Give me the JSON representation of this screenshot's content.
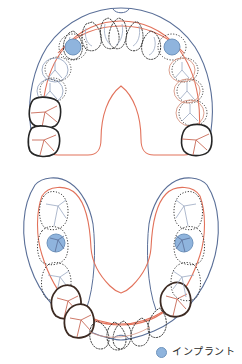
{
  "figure": {
    "title": "",
    "type": "dental-arch-diagram",
    "width": 242,
    "height": 364,
    "background_color": "#ffffff"
  },
  "legend": {
    "items": [
      {
        "marker": "implant-marker",
        "marker_shape": "circle",
        "marker_color": "#8fb4dd",
        "marker_stroke": "#6f94bd",
        "label": "インプラント"
      }
    ]
  },
  "colors": {
    "gingiva_outline": "#5a6f98",
    "denture_base": "#e2725b",
    "tooth_dotted": "#3a3a3a",
    "tooth_solid": "#262626",
    "tooth_light": "#9aa8c2",
    "implant_fill": "#8fb4dd",
    "implant_stroke": "#6f94bd",
    "text": "#2b2b2b"
  },
  "arches": [
    {
      "name": "upper-arch",
      "position": "top",
      "label": "",
      "teeth": [
        {
          "id": "UL8",
          "style": "absent",
          "x": 0,
          "y": 0
        },
        {
          "id": "UL7",
          "style": "solid",
          "x": 44,
          "y": 131,
          "note": "existing-tooth"
        },
        {
          "id": "UL6",
          "style": "solid",
          "x": 45,
          "y": 108,
          "note": "existing-tooth"
        },
        {
          "id": "UL5",
          "style": "light",
          "x": 50,
          "y": 88,
          "note": "prosthetic-tooth"
        },
        {
          "id": "UL4",
          "style": "light",
          "x": 55,
          "y": 70,
          "note": "prosthetic-tooth"
        },
        {
          "id": "UL3",
          "style": "dotted",
          "x": 62,
          "y": 52,
          "note": "denture-tooth"
        },
        {
          "id": "UL2",
          "style": "implant",
          "x": 72,
          "y": 47,
          "note": "implant-site"
        },
        {
          "id": "UL1",
          "style": "dotted",
          "x": 92,
          "y": 28,
          "note": "denture-tooth"
        },
        {
          "id": "UR1",
          "style": "dotted",
          "x": 112,
          "y": 25,
          "note": "denture-tooth"
        },
        {
          "id": "UR2",
          "style": "dotted",
          "x": 132,
          "y": 28,
          "note": "denture-tooth"
        },
        {
          "id": "UR3",
          "style": "implant",
          "x": 172,
          "y": 47,
          "note": "implant-site"
        },
        {
          "id": "UR4",
          "style": "dotted",
          "x": 182,
          "y": 52,
          "note": "denture-tooth"
        },
        {
          "id": "UR5",
          "style": "dotted",
          "x": 189,
          "y": 72,
          "note": "denture-tooth"
        },
        {
          "id": "UR6",
          "style": "dotted",
          "x": 193,
          "y": 94,
          "note": "denture-tooth"
        },
        {
          "id": "UR7",
          "style": "dotted",
          "x": 196,
          "y": 116,
          "note": "denture-tooth"
        },
        {
          "id": "UR8",
          "style": "solid",
          "x": 197,
          "y": 136,
          "note": "existing-tooth"
        }
      ],
      "implants": [
        {
          "id": "upper-left-implant",
          "cx": 74,
          "cy": 47,
          "r": 8
        },
        {
          "id": "upper-right-implant",
          "cx": 172,
          "cy": 47,
          "r": 8
        }
      ]
    },
    {
      "name": "lower-arch",
      "position": "bottom",
      "label": "",
      "teeth": [
        {
          "id": "LL8",
          "style": "light",
          "x": 45,
          "y": 208,
          "note": "prosthetic-tooth"
        },
        {
          "id": "LL7",
          "style": "implant",
          "x": 55,
          "y": 242,
          "note": "implant-site"
        },
        {
          "id": "LL6",
          "style": "light",
          "x": 60,
          "y": 272,
          "note": "prosthetic-tooth"
        },
        {
          "id": "LL5",
          "style": "solid",
          "x": 67,
          "y": 297,
          "note": "existing-tooth"
        },
        {
          "id": "LL4",
          "style": "solid",
          "x": 78,
          "y": 315,
          "note": "existing-tooth"
        },
        {
          "id": "LL3",
          "style": "dotted",
          "x": 96,
          "y": 327,
          "note": "denture-tooth"
        },
        {
          "id": "LL2",
          "style": "dotted",
          "x": 110,
          "y": 331,
          "note": "denture-tooth"
        },
        {
          "id": "LL1",
          "style": "dotted",
          "x": 124,
          "y": 331,
          "note": "denture-tooth"
        },
        {
          "id": "LR1",
          "style": "dotted",
          "x": 138,
          "y": 328,
          "note": "denture-tooth"
        },
        {
          "id": "LR2",
          "style": "dotted",
          "x": 152,
          "y": 322,
          "note": "denture-tooth"
        },
        {
          "id": "LR3",
          "style": "solid",
          "x": 170,
          "y": 300,
          "note": "existing-tooth"
        },
        {
          "id": "LR4",
          "style": "dotted",
          "x": 180,
          "y": 272,
          "note": "denture-tooth"
        },
        {
          "id": "LR5",
          "style": "implant",
          "x": 186,
          "y": 242,
          "note": "implant-site"
        },
        {
          "id": "LR6",
          "style": "dotted",
          "x": 190,
          "y": 208,
          "note": "denture-tooth"
        }
      ],
      "implants": [
        {
          "id": "lower-left-implant",
          "cx": 57,
          "cy": 243,
          "r": 9
        },
        {
          "id": "lower-right-implant",
          "cx": 183,
          "cy": 243,
          "r": 9
        }
      ]
    }
  ]
}
